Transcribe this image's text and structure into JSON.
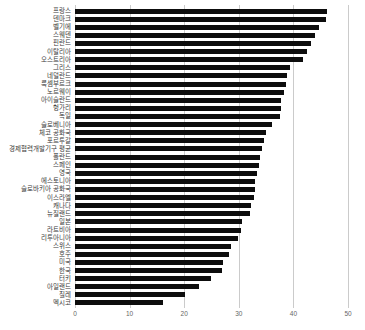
{
  "chart_data": {
    "type": "bar",
    "orientation": "horizontal",
    "title": "",
    "categories": [
      "프랑스",
      "덴마크",
      "벨기에",
      "스웨덴",
      "핀란드",
      "이탈리아",
      "오스트리아",
      "그리스",
      "네덜란드",
      "룩셈부르크",
      "노르웨이",
      "아이슬란드",
      "헝가리",
      "독일",
      "슬로베니아",
      "체코 공화국",
      "포르투갈",
      "경제협력개발기구 평균",
      "폴란드",
      "스페인",
      "영국",
      "에스토니아",
      "슬로바키아 공화국",
      "이스라엘",
      "캐나다",
      "뉴질랜드",
      "일본",
      "라트비아",
      "리투아니아",
      "스위스",
      "호주",
      "미국",
      "한국",
      "터키",
      "아일랜드",
      "칠레",
      "멕시코"
    ],
    "values": [
      46.2,
      46.0,
      44.6,
      44.0,
      43.3,
      42.4,
      41.8,
      39.4,
      38.8,
      38.7,
      38.2,
      37.7,
      37.7,
      37.5,
      36.0,
      34.9,
      34.7,
      34.2,
      33.9,
      33.7,
      33.3,
      33.0,
      32.9,
      32.7,
      32.2,
      32.0,
      30.6,
      30.4,
      29.8,
      28.5,
      28.2,
      27.1,
      26.9,
      24.9,
      22.8,
      20.2,
      16.2
    ],
    "xlabel": "",
    "ylabel": "",
    "xlim": [
      0,
      50
    ],
    "xticks": [
      0,
      10,
      20,
      30,
      40,
      50
    ],
    "grid": "vertical-gridlines",
    "legend": "none",
    "colors": {
      "bar": "#0d0d0d",
      "gridline": "#cbcbcb",
      "category_label": "#3a3a3a",
      "tick_label": "#666666",
      "background": "#ffffff"
    }
  }
}
